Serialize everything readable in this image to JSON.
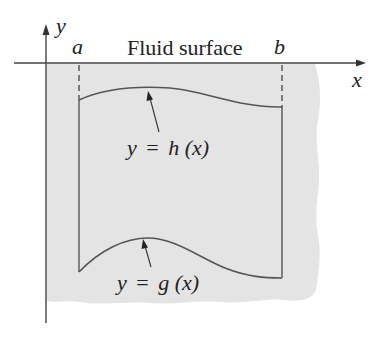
{
  "figure": {
    "labels": {
      "y_axis": "y",
      "x_axis": "x",
      "left_bound": "a",
      "right_bound": "b",
      "surface": "Fluid surface",
      "top_curve": {
        "var": "y",
        "eq": "=",
        "fn": "h",
        "arg": "(x)"
      },
      "bottom_curve": {
        "var": "y",
        "eq": "=",
        "fn": "g",
        "arg": "(x)"
      }
    },
    "colors": {
      "fluid_fill": "#e4e4e4",
      "line": "#555555",
      "axis": "#444444",
      "text": "#222222",
      "background": "#ffffff"
    }
  }
}
